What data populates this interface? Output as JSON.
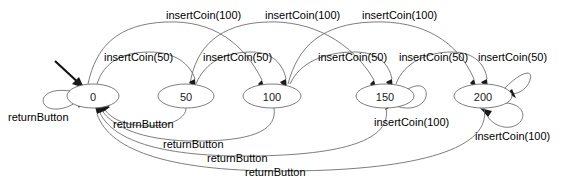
{
  "diagram": {
    "type": "state-machine",
    "title": "",
    "colors": {
      "edge": "#6e6e6e",
      "arrowhead": "#1a1a1a",
      "node_stroke": "#6e6e6e",
      "node_fill": "#ffffff",
      "text": "#1a1a1a",
      "background": "#ffffff",
      "start_arrow": "#111111"
    },
    "states": [
      {
        "id": "s0",
        "label": "0",
        "cx": 93,
        "cy": 96,
        "rx": 26,
        "ry": 12,
        "initial": true
      },
      {
        "id": "s50",
        "label": "50",
        "cx": 186,
        "cy": 96,
        "rx": 28,
        "ry": 12,
        "initial": false
      },
      {
        "id": "s100",
        "label": "100",
        "cx": 272,
        "cy": 96,
        "rx": 29,
        "ry": 12,
        "initial": false
      },
      {
        "id": "s150",
        "label": "150",
        "cx": 385,
        "cy": 96,
        "rx": 29,
        "ry": 12,
        "initial": false
      },
      {
        "id": "s200",
        "label": "200",
        "cx": 483,
        "cy": 96,
        "rx": 29,
        "ry": 12,
        "initial": false
      }
    ],
    "transitions": [
      {
        "from": "s0",
        "to": "s50",
        "label": "insertCoin(50)",
        "label_x": 104,
        "label_y": 52
      },
      {
        "from": "s50",
        "to": "s100",
        "label": "insertCoin(50)",
        "label_x": 203,
        "label_y": 52
      },
      {
        "from": "s100",
        "to": "s150",
        "label": "insertCoin(50)",
        "label_x": 318,
        "label_y": 52
      },
      {
        "from": "s150",
        "to": "s200",
        "label": "insertCoin(50)",
        "label_x": 399,
        "label_y": 52
      },
      {
        "from": "s200",
        "to": "s200",
        "label": "insertCoin(50)",
        "label_x": 478,
        "label_y": 52
      },
      {
        "from": "s0",
        "to": "s100",
        "label": "insertCoin(100)",
        "label_x": 166,
        "label_y": 10
      },
      {
        "from": "s50",
        "to": "s150",
        "label": "insertCoin(100)",
        "label_x": 265,
        "label_y": 10
      },
      {
        "from": "s100",
        "to": "s200",
        "label": "insertCoin(100)",
        "label_x": 362,
        "label_y": 10
      },
      {
        "from": "s150",
        "to": "s150",
        "label": "insertCoin(100)",
        "label_x": 374,
        "label_y": 117
      },
      {
        "from": "s200",
        "to": "s200",
        "label": "insertCoin(100)",
        "label_x": 475,
        "label_y": 131
      },
      {
        "from": "s0",
        "to": "s0",
        "label": "returnButton",
        "label_x": 8,
        "label_y": 112
      },
      {
        "from": "s50",
        "to": "s0",
        "label": "returnButton",
        "label_x": 113,
        "label_y": 119
      },
      {
        "from": "s100",
        "to": "s0",
        "label": "returnButton",
        "label_x": 163,
        "label_y": 139
      },
      {
        "from": "s150",
        "to": "s0",
        "label": "returnButton",
        "label_x": 207,
        "label_y": 153
      },
      {
        "from": "s200",
        "to": "s0",
        "label": "returnButton",
        "label_x": 245,
        "label_y": 167
      }
    ]
  }
}
